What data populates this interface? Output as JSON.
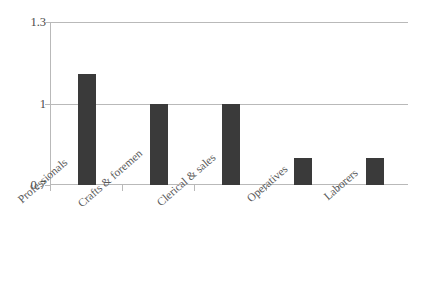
{
  "chart_data": {
    "type": "bar",
    "title": "",
    "subtitle": "",
    "xlabel": "",
    "ylabel": "",
    "categories": [
      "Professionals",
      "Crafts & foremen",
      "Clerical & sales",
      "Operatives",
      "Laborers"
    ],
    "values": [
      1.11,
      1.0,
      1.0,
      0.8,
      0.8
    ],
    "ylim": [
      0.7,
      1.3
    ],
    "yticks": [
      0.7,
      1,
      1.3
    ],
    "ytick_labels": [
      "0.7",
      "1",
      "1.3"
    ],
    "grid": true,
    "legend": false,
    "legend_position": "none",
    "series": [
      {
        "name": "",
        "values": [
          1.11,
          1.0,
          1.0,
          0.8,
          0.8
        ]
      }
    ]
  },
  "style": {
    "bar_color": "#3a3a3a",
    "grid_color": "#b9b9b9",
    "axis_color": "#b9b9b9",
    "text_color": "#555555",
    "background": "#ffffff"
  }
}
